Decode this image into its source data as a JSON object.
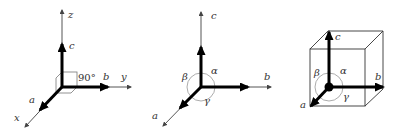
{
  "diagram": {
    "colors": {
      "axis_thin": "#555555",
      "axis_thick": "#000000",
      "arc": "#777777",
      "text": "#333333"
    },
    "panel_cartesian": {
      "axes": {
        "x": "x",
        "y": "y",
        "z": "z"
      },
      "vectors": {
        "a": "a",
        "b": "b",
        "c": "c"
      },
      "angle_label": "90°"
    },
    "panel_general": {
      "vectors": {
        "a": "a",
        "b": "b",
        "c": "c"
      },
      "angles": {
        "alpha": "α",
        "beta": "β",
        "gamma": "γ"
      }
    },
    "panel_cube": {
      "vectors": {
        "a": "a",
        "b": "b",
        "c": "c"
      },
      "angles": {
        "alpha": "α",
        "beta": "β",
        "gamma": "γ"
      }
    }
  }
}
